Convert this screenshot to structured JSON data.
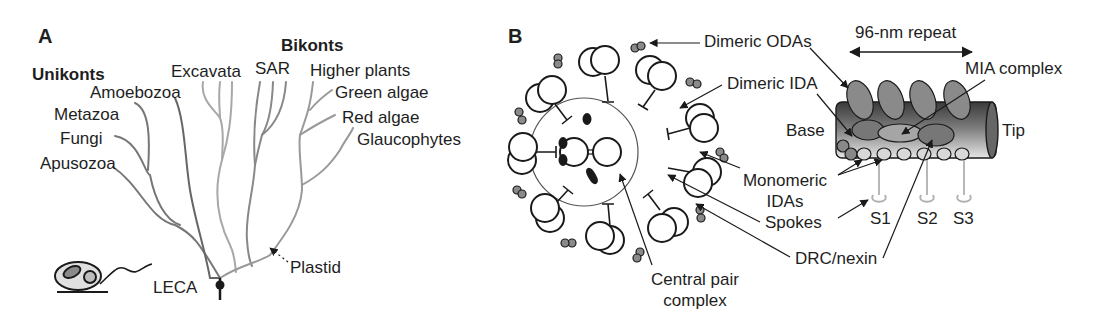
{
  "panel_a": {
    "panel_label": "A",
    "group_unikonts": "Unikonts",
    "group_bikonts": "Bikonts",
    "taxa": {
      "amoebozoa": "Amoebozoa",
      "metazoa": "Metazoa",
      "fungi": "Fungi",
      "apusozoa": "Apusozoa",
      "excavata": "Excavata",
      "sar": "SAR",
      "higher_plants": "Higher plants",
      "green_algae": "Green algae",
      "red_algae": "Red algae",
      "glaucophytes": "Glaucophytes"
    },
    "root_label": "LECA",
    "plastid_label": "Plastid"
  },
  "panel_b": {
    "panel_label": "B",
    "cross_section_labels": {
      "dimeric_odas": "Dimeric ODAs",
      "dimeric_ida": "Dimeric IDA",
      "monomeric_idas_line1": "Monomeric",
      "monomeric_idas_line2": "IDAs",
      "spokes": "Spokes",
      "drc_nexin": "DRC/nexin",
      "central_pair_line1": "Central pair",
      "central_pair_line2": "complex"
    },
    "repeat_labels": {
      "repeat_length": "96-nm repeat",
      "mia_complex": "MIA complex",
      "base": "Base",
      "tip": "Tip",
      "spoke_s1": "S1",
      "spoke_s2": "S2",
      "spoke_s3": "S3"
    }
  },
  "colors": {
    "tree_dark": "#6e6e6e",
    "tree_light": "#a8a8a8",
    "outline": "#1a1a1a",
    "dynein_gray": "#8a8a8a",
    "spoke_gray": "#b5b5b5"
  }
}
